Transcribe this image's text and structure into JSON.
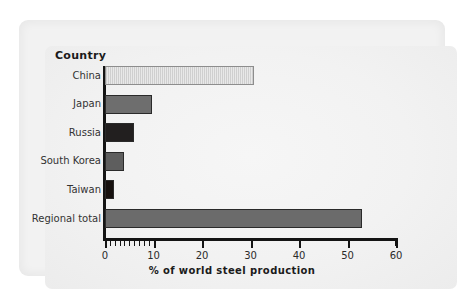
{
  "chart_data": {
    "type": "bar",
    "orientation": "horizontal",
    "title": "",
    "xlabel": "% of world steel production",
    "ylabel": "Country",
    "categories": [
      "China",
      "Japan",
      "Russia",
      "South Korea",
      "Taiwan",
      "Regional total"
    ],
    "values": [
      30.7,
      9.7,
      6.0,
      4.0,
      1.9,
      53.0
    ],
    "xlim": [
      0,
      60
    ],
    "xticks": [
      0,
      10,
      20,
      30,
      40,
      50,
      60
    ],
    "xtick_labels": [
      "0",
      "10",
      "20",
      "30",
      "40",
      "50",
      "60"
    ],
    "minor_tick_interval": 1,
    "minor_ticks_range": [
      0,
      10
    ],
    "grid": false,
    "legend": null,
    "bar_colors": [
      "#cfcfcf",
      "#6e6e6e",
      "#221f1f",
      "#5e5e5e",
      "#16110f",
      "#6b6b6b"
    ],
    "bar_patterns": [
      "vertical-hatch",
      "solid",
      "solid",
      "solid",
      "solid",
      "solid"
    ],
    "bar_edge_color": "#2a2a2a"
  },
  "figure": {
    "background": "#ffffff",
    "panel_background": "#f2f2f2"
  }
}
